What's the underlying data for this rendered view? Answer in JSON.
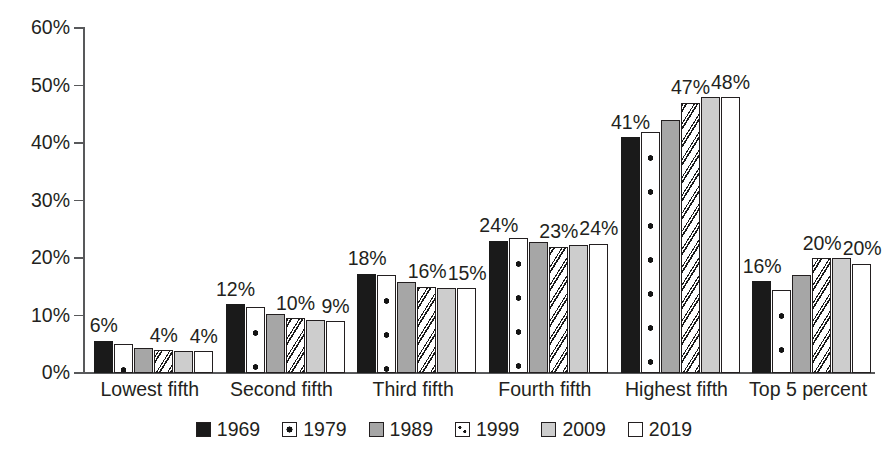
{
  "chart_data": {
    "type": "bar",
    "title": "",
    "subtitle": "",
    "xlabel": "",
    "ylabel": "",
    "ylim": [
      0,
      60
    ],
    "yticks": [
      "0%",
      "10%",
      "20%",
      "30%",
      "40%",
      "50%",
      "60%"
    ],
    "ytick_values": [
      0,
      10,
      20,
      30,
      40,
      50,
      60
    ],
    "grid": false,
    "legend_position": "bottom",
    "categories": [
      "Lowest fifth",
      "Second fifth",
      "Third fifth",
      "Fourth fifth",
      "Highest fifth",
      "Top 5 percent"
    ],
    "series": [
      {
        "name": "1969",
        "pattern": "solid-black",
        "values": [
          5.6,
          12.0,
          17.3,
          23.0,
          41.0,
          16.0
        ]
      },
      {
        "name": "1979",
        "pattern": "white-dotted",
        "values": [
          5.0,
          11.5,
          17.0,
          23.5,
          42.0,
          14.5
        ]
      },
      {
        "name": "1989",
        "pattern": "gray",
        "values": [
          4.4,
          10.3,
          15.8,
          22.8,
          44.0,
          17.0
        ]
      },
      {
        "name": "1999",
        "pattern": "white-diagonal-dots",
        "values": [
          4.0,
          9.5,
          15.0,
          22.0,
          47.0,
          20.0
        ]
      },
      {
        "name": "2009",
        "pattern": "light-gray",
        "values": [
          3.8,
          9.2,
          14.8,
          22.2,
          48.0,
          20.0
        ]
      },
      {
        "name": "2019",
        "pattern": "white",
        "values": [
          3.8,
          9.0,
          14.7,
          22.5,
          48.0,
          19.0
        ]
      }
    ],
    "data_labels": [
      {
        "category": "Lowest fifth",
        "series": "1969",
        "text": "6%"
      },
      {
        "category": "Lowest fifth",
        "series": "1999",
        "text": "4%"
      },
      {
        "category": "Lowest fifth",
        "series": "2019",
        "text": "4%"
      },
      {
        "category": "Second fifth",
        "series": "1969",
        "text": "12%"
      },
      {
        "category": "Second fifth",
        "series": "1999",
        "text": "10%"
      },
      {
        "category": "Second fifth",
        "series": "2019",
        "text": "9%"
      },
      {
        "category": "Third fifth",
        "series": "1969",
        "text": "18%"
      },
      {
        "category": "Third fifth",
        "series": "1999",
        "text": "16%"
      },
      {
        "category": "Third fifth",
        "series": "2019",
        "text": "15%"
      },
      {
        "category": "Fourth fifth",
        "series": "1969",
        "text": "24%"
      },
      {
        "category": "Fourth fifth",
        "series": "1999",
        "text": "23%"
      },
      {
        "category": "Fourth fifth",
        "series": "2019",
        "text": "24%"
      },
      {
        "category": "Highest fifth",
        "series": "1969",
        "text": "41%"
      },
      {
        "category": "Highest fifth",
        "series": "1999",
        "text": "47%"
      },
      {
        "category": "Highest fifth",
        "series": "2019",
        "text": "48%"
      },
      {
        "category": "Top 5 percent",
        "series": "1969",
        "text": "16%"
      },
      {
        "category": "Top 5 percent",
        "series": "1999",
        "text": "20%"
      },
      {
        "category": "Top 5 percent",
        "series": "2019",
        "text": "20%"
      }
    ]
  },
  "colors": {
    "axis": "#58595b",
    "text": "#231f20",
    "series_1969": "#1a1a1a",
    "series_1989": "#a6a6a6",
    "series_2009": "#cdcdcd",
    "series_white": "#ffffff",
    "background": "#ffffff"
  },
  "legend": {
    "items": [
      {
        "label": "1969",
        "swatch": "solid-black-swatch"
      },
      {
        "label": "1979",
        "swatch": "dotted-swatch"
      },
      {
        "label": "1989",
        "swatch": "gray-swatch"
      },
      {
        "label": "1999",
        "swatch": "speckled-swatch"
      },
      {
        "label": "2009",
        "swatch": "light-gray-swatch"
      },
      {
        "label": "2019",
        "swatch": "white-swatch"
      }
    ]
  }
}
